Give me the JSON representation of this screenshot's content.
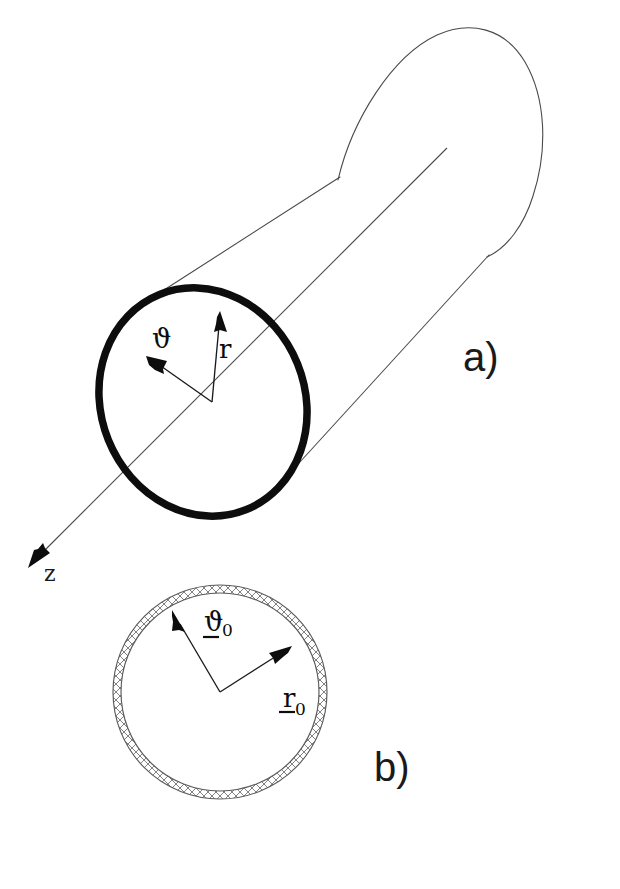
{
  "figure": {
    "background_color": "#ffffff",
    "ink_color": "#0d0d0d",
    "thin_line_color": "#4a4a4a",
    "hatch_color": "#6b6b6b",
    "width": 620,
    "height": 889
  },
  "panels": [
    {
      "id": "a",
      "label": "a)",
      "label_x": 463,
      "label_y": 370,
      "description": "Three-dimensional cylinder with local polar coordinates on the near cross-section"
    },
    {
      "id": "b",
      "label": "b)",
      "label_x": 374,
      "label_y": 780,
      "description": "Cross-sectional view of the hatched circular shell with reference unit vectors"
    }
  ],
  "panel_a": {
    "cylinder": {
      "near_cap": {
        "center_x": 203,
        "center_y": 402,
        "radius_x": 102,
        "radius_y": 116,
        "rotation_deg": -22,
        "stroke_width": 7.5,
        "style": "thick-outline"
      },
      "far_cap": {
        "center_x": 455,
        "center_y": 150,
        "radius_x": 100,
        "radius_y": 115,
        "rotation_deg": -22,
        "style": "thin-arc"
      }
    },
    "axis": {
      "name": "z",
      "label": "z",
      "label_x": 44,
      "label_y": 580,
      "start_x": 447,
      "start_y": 148,
      "end_x": 31,
      "end_y": 563,
      "arrow_at": "end",
      "direction": "down-left"
    },
    "vectors": [
      {
        "name": "theta",
        "label": "ϑ",
        "label_x": 153,
        "label_y": 345,
        "underlined": false,
        "subscript": "",
        "origin_x": 210,
        "origin_y": 401,
        "tip_x": 150,
        "tip_y": 360,
        "direction_deg": 145
      },
      {
        "name": "r",
        "label": "r",
        "label_x": 221,
        "label_y": 357,
        "underlined": false,
        "subscript": "",
        "origin_x": 210,
        "origin_y": 401,
        "tip_x": 218,
        "tip_y": 311,
        "direction_deg": 85
      }
    ]
  },
  "panel_b": {
    "shell": {
      "center_x": 220,
      "center_y": 692,
      "outer_radius": 107,
      "inner_radius": 99,
      "fill": "cross-hatched",
      "hatch_marks": 108,
      "outline_color": "#5a5a5a"
    },
    "vectors": [
      {
        "name": "theta-zero",
        "label": "ϑ",
        "subscript": "0",
        "underlined": true,
        "label_x": 206,
        "label_y": 630,
        "origin_x": 220,
        "origin_y": 692,
        "tip_x": 176,
        "tip_y": 618,
        "direction_deg": 120
      },
      {
        "name": "r-zero",
        "label": "r",
        "subscript": "0",
        "underlined": true,
        "label_x": 282,
        "label_y": 712,
        "origin_x": 220,
        "origin_y": 692,
        "tip_x": 292,
        "tip_y": 645,
        "direction_deg": 33
      }
    ]
  }
}
